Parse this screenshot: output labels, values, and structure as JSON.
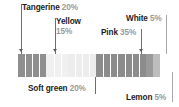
{
  "chart_data": {
    "type": "bar",
    "orientation": "horizontal-stacked",
    "title": "",
    "xlabel": "",
    "ylabel": "",
    "grid": false,
    "legend_position": "callout-labels",
    "categories": [
      "Tangerine",
      "Yellow",
      "Soft green",
      "Pink",
      "White",
      "Lemon"
    ],
    "values": [
      20,
      15,
      20,
      35,
      5,
      5
    ],
    "value_unit": "%",
    "total": 100,
    "segments": [
      {
        "name": "Tangerine",
        "percent_label": "20%",
        "value": 20,
        "fill": "#8f8f8f",
        "stripe": "#9e9e9e",
        "stripe_count": 4
      },
      {
        "name": "Yellow",
        "percent_label": "15%",
        "value": 15,
        "fill": "#f0f0f0",
        "stripe": "#e6e6e6",
        "stripe_count": 3
      },
      {
        "name": "Soft green",
        "percent_label": "20%",
        "value": 20,
        "fill": "#ededed",
        "stripe": "#e2e2e2",
        "stripe_count": 4
      },
      {
        "name": "Pink",
        "percent_label": "35%",
        "value": 35,
        "fill": "#8c8c8c",
        "stripe": "#9b9b9b",
        "stripe_count": 7
      },
      {
        "name": "White",
        "percent_label": "5%",
        "value": 5,
        "fill": "#9a9a9a",
        "stripe": "#a8a8a8",
        "stripe_count": 1
      },
      {
        "name": "Lemon",
        "percent_label": "5%",
        "value": 5,
        "fill": "#bdbdbd",
        "stripe": "#c9c9c9",
        "stripe_count": 1
      }
    ]
  },
  "callouts": {
    "tangerine": {
      "name": "Tangerine",
      "pct": "20%"
    },
    "yellow": {
      "name": "Yellow",
      "pct": "15%"
    },
    "white": {
      "name": "White",
      "pct": "5%"
    },
    "pink": {
      "name": "Pink",
      "pct": "35%"
    },
    "soft_green": {
      "name": "Soft green",
      "pct": "20%"
    },
    "lemon": {
      "name": "Lemon",
      "pct": "5%"
    }
  },
  "colors": {
    "label_text": "#1d1d1d",
    "percent_text": "#9a9a9a",
    "leader_line": "#a8a8a8",
    "background": "#ffffff"
  }
}
